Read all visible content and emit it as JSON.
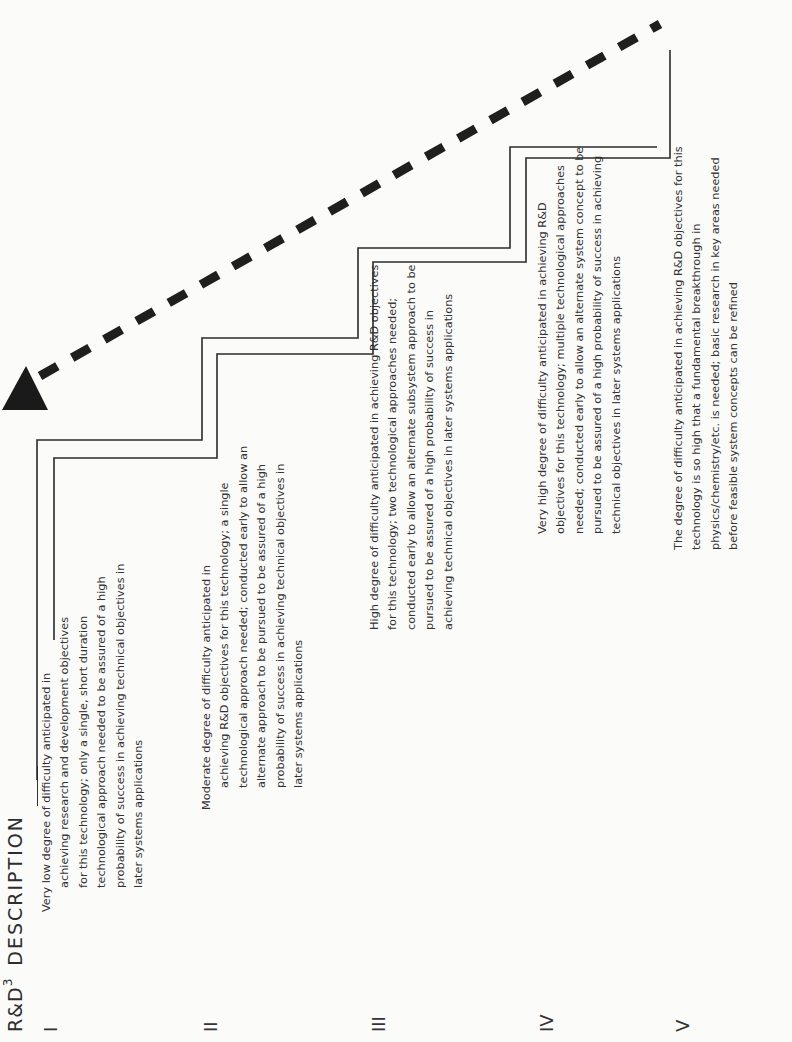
{
  "header": {
    "level_label": "R&D",
    "level_superscript": "3",
    "description_label": "DESCRIPTION"
  },
  "levels": [
    {
      "numeral": "I",
      "lines": [
        "Very low degree of difficulty anticipated in",
        "achieving research and development objectives",
        "for this technology; only a single, short duration",
        "technological approach needed to be assured of a high",
        "probability of success in achieving technical objectives in",
        "later systems applications"
      ]
    },
    {
      "numeral": "II",
      "lines": [
        "Moderate degree of difficulty anticipated in",
        "achieving R&D objectives for this technology; a single",
        "technological approach needed; conducted early to allow an",
        "alternate approach to be pursued to be assured of a high",
        "probability of success in achieving technical objectives in",
        "later systems applications"
      ]
    },
    {
      "numeral": "III",
      "lines": [
        "High degree of difficulty anticipated in achieving R&D objectives",
        "for this technology; two technological approaches needed;",
        "conducted early to allow an alternate subsystem approach to be",
        "pursued to be assured of a high probability of success in",
        "achieving technical objectives in later systems applications"
      ]
    },
    {
      "numeral": "IV",
      "lines": [
        "Very high degree of difficulty anticipated in achieving R&D",
        "objectives for this technology; multiple technological approaches",
        "needed; conducted early to allow an alternate system concept to be",
        "pursued to be assured of a high probability of success in achieving",
        "technical objectives in later systems applications"
      ]
    },
    {
      "numeral": "V",
      "lines": [
        "The degree of difficulty anticipated in achieving R&D objectives for this",
        "technology is so high that a fundamental breakthrough in",
        "physics/chemistry/etc. is needed; basic research in key areas needed",
        "before feasible system concepts can be refined"
      ]
    }
  ],
  "diagram": {
    "arrow_label": "",
    "arrow_direction": "increasing difficulty (dashed diagonal arrow)",
    "line_color": "#2b2b2b",
    "background_color": "#fbfbfa"
  }
}
